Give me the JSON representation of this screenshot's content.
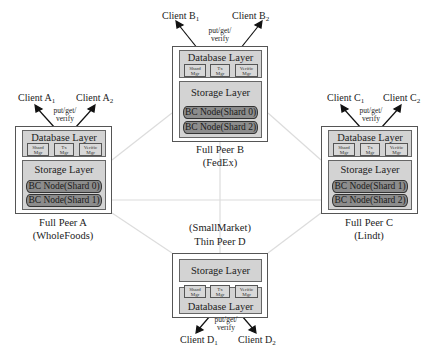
{
  "diagram": {
    "type": "blockchain-sharded-database-network",
    "connection_color": "#d9d9d9",
    "peer_border_color": "#555555",
    "layer_fill_color": "#d3d3d3",
    "shard_fill_color": "#8c8c8c",
    "client_link_label": [
      "put/get/",
      "verify"
    ],
    "manager_labels": {
      "shard": [
        "Shard",
        "Mgr"
      ],
      "tx": [
        "Tx",
        "Mgr"
      ],
      "verify": [
        "Verific",
        "Mgr"
      ]
    },
    "layer_labels": {
      "database": "Database Layer",
      "storage": "Storage Layer"
    },
    "peers": {
      "b": {
        "name": "Full Peer B",
        "org": "(FedEx)",
        "clients": [
          {
            "base": "Client B",
            "sub": "1"
          },
          {
            "base": "Client B",
            "sub": "2"
          }
        ],
        "shards": [
          "BC Node(Shard 0)",
          "BC Node(Shard 2)"
        ]
      },
      "a": {
        "name": "Full Peer A",
        "org": "(WholeFoods)",
        "clients": [
          {
            "base": "Client A",
            "sub": "1"
          },
          {
            "base": "Client A",
            "sub": "2"
          }
        ],
        "shards": [
          "BC Node(Shard 0)",
          "BC Node(Shard 1)"
        ]
      },
      "c": {
        "name": "Full Peer C",
        "org": "(Lindt)",
        "clients": [
          {
            "base": "Client C",
            "sub": "1"
          },
          {
            "base": "Client C",
            "sub": "2"
          }
        ],
        "shards": [
          "BC Node(Shard 1)",
          "BC Node(Shard 2)"
        ]
      },
      "d": {
        "name": "Thin Peer D",
        "org": "(SmallMarket)",
        "clients": [
          {
            "base": "Client D",
            "sub": "1"
          },
          {
            "base": "Client D",
            "sub": "2"
          }
        ],
        "shards": []
      }
    }
  }
}
